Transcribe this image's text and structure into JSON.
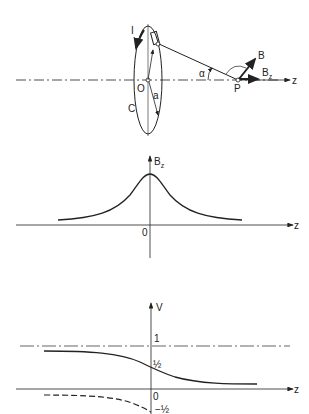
{
  "figure": {
    "panel_top": {
      "labels": {
        "current": "I",
        "origin": "O",
        "loop": "C",
        "radius": "a",
        "angle": "α",
        "point": "P",
        "field": "B",
        "field_axial": "B",
        "field_axial_sub": "z",
        "axis": "z"
      }
    },
    "panel_middle": {
      "labels": {
        "ylabel": "B",
        "ylabel_sub": "z",
        "origin": "0",
        "axis": "z"
      }
    },
    "panel_bottom": {
      "labels": {
        "ylabel": "V",
        "tick_one": "1",
        "tick_half": "½",
        "origin": "0",
        "tick_neg_half": "−½",
        "axis": "z"
      }
    },
    "colors": {
      "ink": "#222222",
      "background": "#ffffff"
    }
  }
}
